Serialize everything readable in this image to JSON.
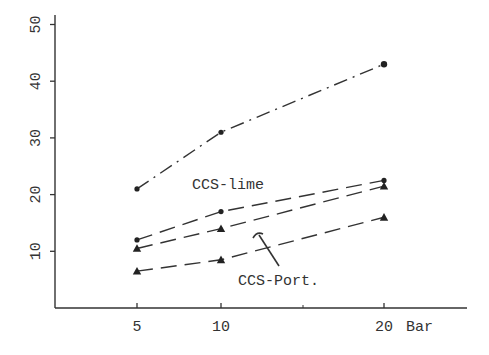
{
  "chart_data": {
    "type": "line",
    "title": "",
    "xlabel": "Bar",
    "ylabel": "",
    "x": [
      5,
      10,
      20
    ],
    "x_ticks": [
      "5",
      "10",
      "20"
    ],
    "x_unit_label": "Bar",
    "y_ticks": [
      "10",
      "20",
      "30",
      "40",
      "50"
    ],
    "ylim": [
      0,
      50
    ],
    "xlim": [
      0,
      27
    ],
    "grid": false,
    "legend": "none (inline annotations)",
    "series": [
      {
        "name": "CCS-lime (upper)",
        "marker": "circle",
        "values": [
          21,
          31,
          43
        ]
      },
      {
        "name": "CCS-lime (lower)",
        "marker": "circle",
        "values": [
          12,
          17,
          22.5
        ]
      },
      {
        "name": "CCS-Port. (upper)",
        "marker": "triangle",
        "values": [
          10.5,
          14,
          21.5
        ]
      },
      {
        "name": "CCS-Port. (lower)",
        "marker": "triangle",
        "values": [
          6.5,
          8.5,
          16
        ]
      }
    ],
    "annotations": [
      {
        "text": "CCS-lime",
        "x": 9.3,
        "y": 22
      },
      {
        "text": "CCS-Port.",
        "x": 11.5,
        "y": 4,
        "arrow_to": {
          "x": 12,
          "y": 13
        }
      }
    ]
  },
  "labels": {
    "ccs_lime": "CCS-lime",
    "ccs_port": "CCS-Port.",
    "x_unit": "Bar"
  }
}
